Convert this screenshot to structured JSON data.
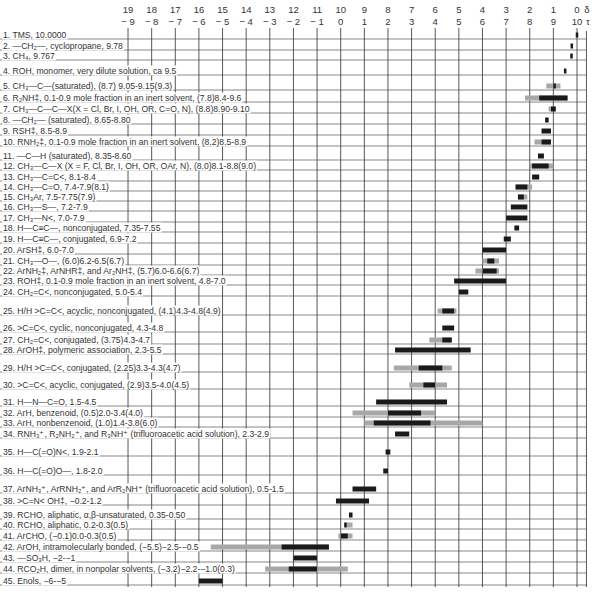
{
  "chart_data": {
    "type": "bar",
    "subtype": "horizontal range chart (NMR chemical shift correlation)",
    "title": "",
    "xaxis_top": {
      "label": "δ",
      "ticks": [
        19,
        18,
        17,
        16,
        15,
        14,
        13,
        12,
        11,
        10,
        9,
        8,
        7,
        6,
        5,
        4,
        3,
        2,
        1,
        0
      ]
    },
    "xaxis_bottom": {
      "label": "τ",
      "ticks": [
        -9,
        -8,
        -7,
        -6,
        -5,
        -4,
        -3,
        -2,
        -1,
        0,
        1,
        2,
        3,
        4,
        5,
        6,
        7,
        8,
        9,
        10
      ]
    },
    "xlim_delta": [
      19,
      0
    ],
    "grid": true,
    "legend": {
      "dark": "typical range",
      "gray": "extended range (parenthetical values)"
    },
    "rows": [
      {
        "n": 1,
        "label": "TMS, 10.0000",
        "tau_main": [
          10.0,
          10.0
        ],
        "tau_ext": null
      },
      {
        "n": 2,
        "label": "—CH₂—, cyclopropane, 9.78",
        "tau_main": [
          9.78,
          9.78
        ],
        "tau_ext": null
      },
      {
        "n": 3,
        "label": "CH₄, 9.767",
        "tau_main": [
          9.767,
          9.767
        ],
        "tau_ext": null
      },
      {
        "n": 4,
        "label": "ROH, monomer, very dilute solution, ca 9.5",
        "tau_main": [
          9.5,
          9.5
        ],
        "tau_ext": null
      },
      {
        "n": 5,
        "label": "CH₃—C—(saturated), (8.7) 9.05-9.15(9.3)",
        "tau_main": [
          9.05,
          9.15
        ],
        "tau_ext": [
          8.7,
          9.3
        ]
      },
      {
        "n": 6,
        "label": "R₂NH‡, 0.1-0.9 mole fraction in an inert solvent, (7.8)8.4-9.6",
        "tau_main": [
          8.4,
          9.6
        ],
        "tau_ext": [
          7.8,
          9.6
        ]
      },
      {
        "n": 7,
        "label": "CH₃—C—C—X(X = Cl, Br, I, OH, OR, C=O, N), (8.8)8.90-9.10",
        "tau_main": [
          8.9,
          9.1
        ],
        "tau_ext": [
          8.8,
          9.1
        ]
      },
      {
        "n": 8,
        "label": "—CH₂— (saturated), 8.65-8.80",
        "tau_main": [
          8.65,
          8.8
        ],
        "tau_ext": null
      },
      {
        "n": 9,
        "label": "RSH‡, 8.5-8.9",
        "tau_main": [
          8.5,
          8.9
        ],
        "tau_ext": null
      },
      {
        "n": 10,
        "label": "RNH₂‡, 0.1-0.9 mole fraction in an inert solvent, (8.2)8.5-8.9",
        "tau_main": [
          8.5,
          8.9
        ],
        "tau_ext": [
          8.2,
          8.9
        ]
      },
      {
        "n": 11,
        "label": "—C—H (saturated), 8.35-8.60",
        "tau_main": [
          8.35,
          8.6
        ],
        "tau_ext": null
      },
      {
        "n": 12,
        "label": "CH₃—C—X (X = F, Cl, Br, I, OH, OR, OAr, N), (8.0)8.1-8.8(9.0)",
        "tau_main": [
          8.1,
          8.8
        ],
        "tau_ext": [
          8.0,
          9.0
        ]
      },
      {
        "n": 13,
        "label": "CH₃—C=C<, 8.1-8.4",
        "tau_main": [
          8.1,
          8.4
        ],
        "tau_ext": null
      },
      {
        "n": 14,
        "label": "CH₃—C=O, 7.4-7.9(8.1)",
        "tau_main": [
          7.4,
          7.9
        ],
        "tau_ext": [
          7.4,
          8.1
        ]
      },
      {
        "n": 15,
        "label": "CH₃Ar, 7.5-7.75(7.9)",
        "tau_main": [
          7.5,
          7.75
        ],
        "tau_ext": [
          7.5,
          7.9
        ]
      },
      {
        "n": 16,
        "label": "CH₃—S—, 7.2-7.9",
        "tau_main": [
          7.2,
          7.9
        ],
        "tau_ext": null
      },
      {
        "n": 17,
        "label": "CH₃—N<, 7.0-7.9",
        "tau_main": [
          7.0,
          7.9
        ],
        "tau_ext": null
      },
      {
        "n": 18,
        "label": "H—C≡C—, nonconjugated, 7.35-7.55",
        "tau_main": [
          7.35,
          7.55
        ],
        "tau_ext": null
      },
      {
        "n": 19,
        "label": "H—C≡C—, conjugated, 6.9-7.2",
        "tau_main": [
          6.9,
          7.2
        ],
        "tau_ext": null
      },
      {
        "n": 20,
        "label": "ArSH‡, 6.0-7.0",
        "tau_main": [
          6.0,
          7.0
        ],
        "tau_ext": null
      },
      {
        "n": 21,
        "label": "CH₃—O—, (6.0)6.2-6.5(6.7)",
        "tau_main": [
          6.2,
          6.5
        ],
        "tau_ext": [
          6.0,
          6.7
        ]
      },
      {
        "n": 22,
        "label": "ArNH₂‡, ArNHR‡, and Ar₂NH‡, (5.7)6.0-6.6(6.7)",
        "tau_main": [
          6.0,
          6.6
        ],
        "tau_ext": [
          5.7,
          6.7
        ]
      },
      {
        "n": 23,
        "label": "ROH‡, 0.1-0.9 mole fraction in an inert solvent, 4.8-7.0",
        "tau_main": [
          4.8,
          7.0
        ],
        "tau_ext": null
      },
      {
        "n": 24,
        "label": "CH₂=C<, nonconjugated, 5.0-5.4",
        "tau_main": [
          5.0,
          5.4
        ],
        "tau_ext": null
      },
      {
        "n": 25,
        "label": "H/H >C=C<, acyclic, nonconjugated, (4.1)4.3-4.8(4.9)",
        "tau_main": [
          4.3,
          4.8
        ],
        "tau_ext": [
          4.1,
          4.9
        ]
      },
      {
        "n": 26,
        "label": ">C=C<, cyclic, nonconjugated, 4.3-4.8",
        "tau_main": [
          4.3,
          4.8
        ],
        "tau_ext": null
      },
      {
        "n": 27,
        "label": "CH₂=C<, conjugated, (3.75)4.3-4.7",
        "tau_main": [
          4.3,
          4.7
        ],
        "tau_ext": [
          3.75,
          4.7
        ]
      },
      {
        "n": 28,
        "label": "ArOH‡, polymeric association, 2.3-5.5",
        "tau_main": [
          2.3,
          5.5
        ],
        "tau_ext": null
      },
      {
        "n": 29,
        "label": "H/H >C=C<, conjugated, (2.25)3.3-4.3(4.7)",
        "tau_main": [
          3.3,
          4.3
        ],
        "tau_ext": [
          2.25,
          4.7
        ]
      },
      {
        "n": 30,
        "label": ">C=C<, acyclic, conjugated, (2.9)3.5-4.0(4.5)",
        "tau_main": [
          3.5,
          4.0
        ],
        "tau_ext": [
          2.9,
          4.5
        ]
      },
      {
        "n": 31,
        "label": "H—N—C=O, 1.5-4.5",
        "tau_main": [
          1.5,
          4.5
        ],
        "tau_ext": null
      },
      {
        "n": 32,
        "label": "ArH, benzenoid, (0.5)2.0-3.4(4.0)",
        "tau_main": [
          2.0,
          3.4
        ],
        "tau_ext": [
          0.5,
          4.0
        ]
      },
      {
        "n": 33,
        "label": "ArH, nonbenzenoid, (1.0)1.4-3.8(6.0)",
        "tau_main": [
          1.4,
          3.8
        ],
        "tau_ext": [
          1.0,
          6.0
        ]
      },
      {
        "n": 34,
        "label": "RNH₃⁺, R₂NH₂⁺, and R₃NH⁺ (trifluoroacetic acid solution), 2.3-2.9",
        "tau_main": [
          2.3,
          2.9
        ],
        "tau_ext": null
      },
      {
        "n": 35,
        "label": "H—C(=O)N<, 1.9-2.1",
        "tau_main": [
          1.9,
          2.1
        ],
        "tau_ext": null
      },
      {
        "n": 36,
        "label": "H—C(=O)O—, 1.8-2.0",
        "tau_main": [
          1.8,
          2.0
        ],
        "tau_ext": null
      },
      {
        "n": 37,
        "label": "ArNH₃⁺, ArRNH₂⁺, and ArR₂NH⁺ (trifluoroacetic acid solution), 0.5-1.5",
        "tau_main": [
          0.5,
          1.5
        ],
        "tau_ext": null
      },
      {
        "n": 38,
        "label": ">C=N< OH‡, −0.2-1.2",
        "tau_main": [
          -0.2,
          1.2
        ],
        "tau_ext": null
      },
      {
        "n": 39,
        "label": "RCHO, aliphatic, α,β-unsaturated, 0.35-0.50",
        "tau_main": [
          0.35,
          0.5
        ],
        "tau_ext": null
      },
      {
        "n": 40,
        "label": "RCHO, aliphatic, 0.2-0.3(0.5)",
        "tau_main": [
          0.2,
          0.3
        ],
        "tau_ext": [
          0.2,
          0.5
        ]
      },
      {
        "n": 41,
        "label": "ArCHO, (−0.1)0.0-0.3(0.5)",
        "tau_main": [
          0.0,
          0.3
        ],
        "tau_ext": [
          -0.1,
          0.5
        ]
      },
      {
        "n": 42,
        "label": "ArOH, intramolecularly bonded, (−5.5)−2.5-−0.5",
        "tau_main": [
          -2.5,
          -0.5
        ],
        "tau_ext": [
          -5.5,
          -0.5
        ]
      },
      {
        "n": 43,
        "label": "—SO₃H, −2-−1",
        "tau_main": [
          -2.0,
          -1.0
        ],
        "tau_ext": null
      },
      {
        "n": 44,
        "label": "RCO₂H, dimer, in nonpolar solvents, (−3.2)−2.2-−1.0(0.3)",
        "tau_main": [
          -2.2,
          -1.0
        ],
        "tau_ext": [
          -3.2,
          0.3
        ]
      },
      {
        "n": 45,
        "label": "Enols, −6-−5",
        "tau_main": [
          -6.0,
          -5.0
        ],
        "tau_ext": null
      }
    ]
  },
  "layout": {
    "x_delta0": 577,
    "px_per_unit": 23.63,
    "row_y": [
      35,
      46,
      56,
      71,
      86,
      98,
      109,
      120,
      131,
      142,
      156,
      166,
      177,
      187,
      197,
      207,
      218,
      228,
      239,
      250,
      261,
      271,
      281,
      292,
      311,
      328,
      340,
      350,
      368,
      385,
      402,
      413,
      423,
      434,
      452,
      471,
      489,
      501,
      515,
      525,
      536,
      547,
      558,
      569,
      581
    ],
    "colors": {
      "main_bar": "#1a1a1a",
      "ext_bar": "#a8a8a8",
      "grid": "#444444",
      "text": "#333333"
    }
  }
}
